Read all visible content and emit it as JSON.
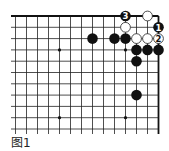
{
  "diagram": {
    "type": "go-board-fragment",
    "caption": "图1",
    "grid": {
      "columns": 14,
      "rows": 12,
      "origin_x": 15.5,
      "origin_y": 16,
      "spacing_x": 11.0,
      "spacing_y": 11.3,
      "right_edge": true,
      "top_edge": true,
      "line_color": "#222222",
      "edge_color": "#111111"
    },
    "star_points": [
      {
        "col": 4,
        "row": 3
      },
      {
        "col": 10,
        "row": 3
      },
      {
        "col": 4,
        "row": 9
      },
      {
        "col": 10,
        "row": 9
      }
    ],
    "stones": [
      {
        "color": "black",
        "col": 7,
        "row": 2,
        "label": ""
      },
      {
        "color": "black",
        "col": 9,
        "row": 2,
        "label": ""
      },
      {
        "color": "black",
        "col": 10,
        "row": 2,
        "label": ""
      },
      {
        "color": "white",
        "col": 11,
        "row": 2,
        "label": ""
      },
      {
        "color": "white",
        "col": 12,
        "row": 2,
        "label": ""
      },
      {
        "color": "white",
        "col": 13,
        "row": 2,
        "label": "2"
      },
      {
        "color": "black",
        "col": 10,
        "row": 0,
        "label": "3"
      },
      {
        "color": "white",
        "col": 12,
        "row": 0,
        "label": ""
      },
      {
        "color": "white",
        "col": 10,
        "row": 1,
        "label": ""
      },
      {
        "color": "black",
        "col": 13,
        "row": 1,
        "label": "1"
      },
      {
        "color": "black",
        "col": 11,
        "row": 3,
        "label": ""
      },
      {
        "color": "black",
        "col": 12,
        "row": 3,
        "label": ""
      },
      {
        "color": "black",
        "col": 13,
        "row": 3,
        "label": ""
      },
      {
        "color": "black",
        "col": 11,
        "row": 4,
        "label": ""
      },
      {
        "color": "black",
        "col": 11,
        "row": 7,
        "label": ""
      }
    ],
    "colors": {
      "black_stone": "#111111",
      "white_stone": "#ffffff",
      "white_stroke": "#222222",
      "label_on_black": "#ffffff",
      "label_on_white": "#111111"
    }
  }
}
